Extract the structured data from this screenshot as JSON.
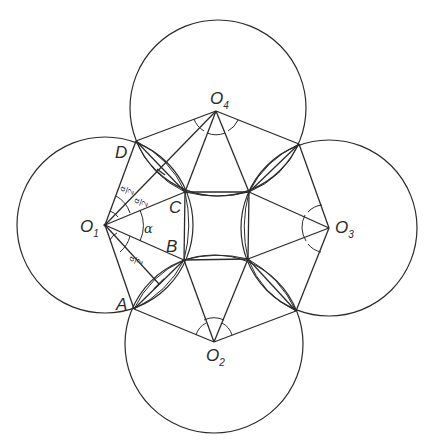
{
  "diagram": {
    "title": "",
    "centers": [
      {
        "id": "O1",
        "label": "O",
        "sub": "1",
        "x": 105,
        "y": 225
      },
      {
        "id": "O2",
        "label": "O",
        "sub": "2",
        "x": 214,
        "y": 342
      },
      {
        "id": "O3",
        "label": "O",
        "sub": "3",
        "x": 329,
        "y": 228
      },
      {
        "id": "O4",
        "label": "O",
        "sub": "4",
        "x": 216,
        "y": 111
      }
    ],
    "radius": 88,
    "points": [
      {
        "id": "A",
        "label": "A",
        "x": 134,
        "y": 309
      },
      {
        "id": "B",
        "label": "B",
        "x": 184,
        "y": 260
      },
      {
        "id": "C",
        "label": "C",
        "x": 185,
        "y": 192
      },
      {
        "id": "D",
        "label": "D",
        "x": 136,
        "y": 141
      }
    ],
    "angle_labels": {
      "alpha": "α",
      "half_alpha_num": "α",
      "half_alpha_den": "2"
    }
  }
}
